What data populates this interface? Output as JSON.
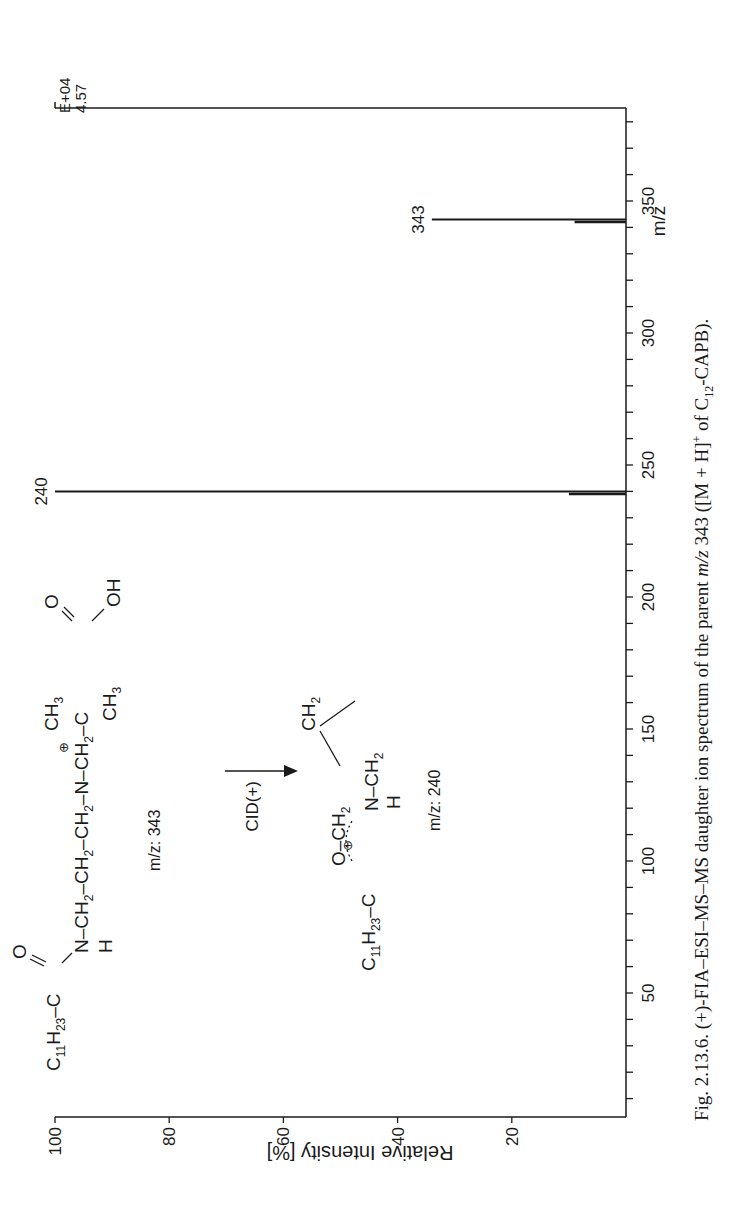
{
  "chart_data": {
    "type": "bar",
    "subtype": "mass-spectrum-stick",
    "orientation": "rotated-90-ccw",
    "title": "",
    "xlabel": "m/z",
    "ylabel": "Relative Intensity [%]",
    "xlim": [
      5,
      385
    ],
    "ylim": [
      0,
      100
    ],
    "x_ticks_labeled": [
      50,
      100,
      150,
      200,
      250,
      300,
      350
    ],
    "x_minor_tick_step": 10,
    "y_ticks": [
      20,
      40,
      60,
      80,
      100
    ],
    "scale_label_top": "E+04",
    "scale_label_value": "4.57",
    "grid": false,
    "peaks": [
      {
        "mz": 239,
        "intensity": 10,
        "label": ""
      },
      {
        "mz": 240,
        "intensity": 100,
        "label": "240"
      },
      {
        "mz": 342,
        "intensity": 9,
        "label": ""
      },
      {
        "mz": 343,
        "intensity": 34,
        "label": "343"
      }
    ]
  },
  "annotations": {
    "parent": {
      "formula_left": "C11H23",
      "chain": "N-CH2-CH2-CH2-N-CH2-C",
      "mz_label": "m/z: 343"
    },
    "reaction_label": "CID(+)",
    "fragment": {
      "formula_left": "C11H23",
      "ring_top": "O-CH2",
      "ring_mid": "CH2",
      "ring_bottom": "N-CH2",
      "mz_label": "m/z: 240"
    }
  },
  "caption": {
    "prefix": "Fig. 2.13.6.",
    "text_1": " (+)-FIA–ESI–MS–MS daughter ion spectrum of the parent ",
    "mz_italic": "m/z",
    "text_2": " 343 ([M + H]",
    "sup": "+",
    "text_3": " of C",
    "sub": "12",
    "text_4": "-CAPB)."
  }
}
